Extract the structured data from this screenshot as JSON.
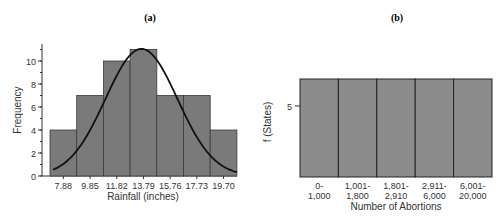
{
  "chart_data": [
    {
      "type": "bar",
      "title": "(a)",
      "xlabel": "Rainfall (inches)",
      "ylabel": "Frequency",
      "categories": [
        "7.88",
        "9.85",
        "11.82",
        "13.79",
        "15.76",
        "17.73",
        "19.70"
      ],
      "values": [
        4,
        7,
        10,
        11,
        7,
        7,
        4
      ],
      "yticks": [
        0,
        2,
        4,
        6,
        8,
        10
      ],
      "ylim": [
        0,
        11.5
      ],
      "overlay": "normal curve",
      "bar_color": "#7a7a7a",
      "grid": false
    },
    {
      "type": "bar",
      "title": "(b)",
      "xlabel": "Number of Abortions",
      "ylabel": "f (States)",
      "categories": [
        "0-\n1,000",
        "1,001-\n1,800",
        "1,801-\n2,910",
        "2,911-\n6,000",
        "6,001-\n20,000"
      ],
      "category_lines": [
        [
          "0-",
          "1,000"
        ],
        [
          "1,001-",
          "1,800"
        ],
        [
          "1,801-",
          "2,910"
        ],
        [
          "2,911-",
          "6,000"
        ],
        [
          "6,001-",
          "20,000"
        ]
      ],
      "values": [
        6,
        6,
        6,
        6,
        6
      ],
      "yticks": [
        5
      ],
      "bar_color": "#8c8c8c",
      "grid": false
    }
  ]
}
